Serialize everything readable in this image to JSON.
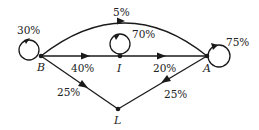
{
  "diagram": {
    "type": "state-transition-graph",
    "nodes": [
      {
        "id": "B",
        "label": "B"
      },
      {
        "id": "I",
        "label": "I"
      },
      {
        "id": "A",
        "label": "A"
      },
      {
        "id": "L",
        "label": "L"
      }
    ],
    "edges": [
      {
        "from": "B",
        "to": "B",
        "label": "30%"
      },
      {
        "from": "B",
        "to": "A",
        "label": "5%"
      },
      {
        "from": "B",
        "to": "I",
        "label": "40%"
      },
      {
        "from": "I",
        "to": "I",
        "label": "70%"
      },
      {
        "from": "I",
        "to": "A",
        "label": "20%"
      },
      {
        "from": "A",
        "to": "A",
        "label": "75%"
      },
      {
        "from": "B",
        "to": "L",
        "label": "25%"
      },
      {
        "from": "A",
        "to": "L",
        "label": "25%"
      }
    ]
  }
}
